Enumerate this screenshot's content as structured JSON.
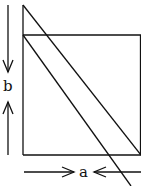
{
  "diagram": {
    "labels": {
      "b": "b",
      "a": "a"
    },
    "colors": {
      "stroke": "#111111",
      "background": "#ffffff"
    }
  }
}
